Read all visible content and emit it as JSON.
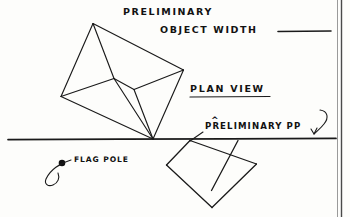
{
  "page": {
    "kind": "hand-drawn-perspective-sketch",
    "width": 350,
    "height": 217,
    "ink_color": "#1a1a1a",
    "paper_color": "#fdfdfb"
  },
  "labels": {
    "title_line1": "PRELIMINARY",
    "title_line2": "OBJECT  WIDTH",
    "plan_view": "PLAN  VIEW",
    "preliminary_pp": "PRELIMINARY  PP",
    "flag_pole": "FLAG  POLE",
    "caret": "^"
  },
  "annotations": {
    "blank_fill_in_line": "",
    "plan_view_underlined": true,
    "pp_has_arrow_hook": true,
    "flag_pole_has_leader_loop": true
  },
  "geometry": {
    "horizon_line": {
      "x1": 8,
      "y1": 139,
      "x2": 336,
      "y2": 139
    },
    "object_polygon_vertices": [
      {
        "name": "apex-top",
        "x": 93,
        "y": 23
      },
      {
        "name": "right",
        "x": 183,
        "y": 70
      },
      {
        "name": "bottom-on-horizon",
        "x": 153,
        "y": 139
      },
      {
        "name": "left",
        "x": 61,
        "y": 96
      }
    ],
    "object_interior_vertices": [
      {
        "name": "interior-upper",
        "x": 114,
        "y": 78
      },
      {
        "name": "interior-lower",
        "x": 134,
        "y": 89
      }
    ],
    "picture_plane_square_vertices": [
      {
        "name": "pp-top",
        "x": 190,
        "y": 141
      },
      {
        "name": "pp-right",
        "x": 256,
        "y": 164
      },
      {
        "name": "pp-bottom",
        "x": 212,
        "y": 207
      },
      {
        "name": "pp-left",
        "x": 167,
        "y": 165
      }
    ],
    "picture_plane_diagonal": {
      "x1": 238,
      "y1": 141,
      "x2": 212,
      "y2": 190
    },
    "flag_pole_point": {
      "x": 62,
      "y": 163,
      "r": 3.2
    },
    "blank_line": {
      "x1": 278,
      "y1": 31,
      "x2": 331,
      "y2": 31
    },
    "plan_view_underline": {
      "x1": 190,
      "y1": 97,
      "x2": 270,
      "y2": 97
    }
  }
}
